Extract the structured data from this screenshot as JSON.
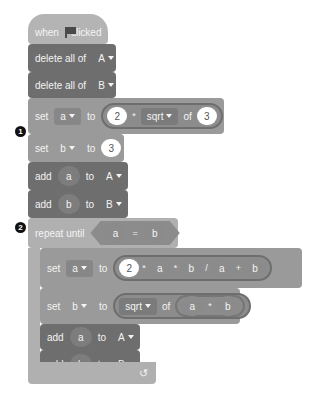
{
  "script": {
    "hat": {
      "label_before": "when",
      "icon": "green-flag-icon",
      "label_after": "clicked"
    },
    "delete_a": {
      "label": "delete all of",
      "list": "A"
    },
    "delete_b": {
      "label": "delete all of",
      "list": "B"
    },
    "marker1": "1",
    "set_a1": {
      "label": "set",
      "var": "a",
      "to": "to",
      "expr": {
        "left": "2",
        "op": "*",
        "func": "sqrt",
        "of": "of",
        "arg": "3"
      }
    },
    "set_b1": {
      "label": "set",
      "var": "b",
      "to": "to",
      "value": "3"
    },
    "add_a1": {
      "label": "add",
      "item": "a",
      "to": "to",
      "list": "A"
    },
    "add_b1": {
      "label": "add",
      "item": "b",
      "to": "to",
      "list": "B"
    },
    "marker2": "2",
    "repeat": {
      "label": "repeat until",
      "cond": {
        "left": "a",
        "op": "=",
        "right": "b"
      },
      "loop_icon": "↺"
    },
    "set_a2": {
      "label": "set",
      "var": "a",
      "to": "to",
      "expr": {
        "n": "2",
        "op1": "*",
        "x": "a",
        "op2": "*",
        "y": "b",
        "op3": "/",
        "p": "a",
        "op4": "+",
        "q": "b"
      }
    },
    "set_b2": {
      "label": "set",
      "var": "b",
      "to": "to",
      "expr": {
        "func": "sqrt",
        "of": "of",
        "x": "a",
        "op": "*",
        "y": "b"
      }
    },
    "add_a2": {
      "label": "add",
      "item": "a",
      "to": "to",
      "list": "A"
    },
    "add_b2": {
      "label": "add",
      "item": "b",
      "to": "to",
      "list": "B"
    }
  },
  "colors": {
    "hat": "#b4b4b4",
    "variable_block": "#9a9a9a",
    "list_block": "#6e6e6e",
    "control_block": "#b0b0b0",
    "operator": "#8c8c8c",
    "number_input": "#ffffff"
  }
}
